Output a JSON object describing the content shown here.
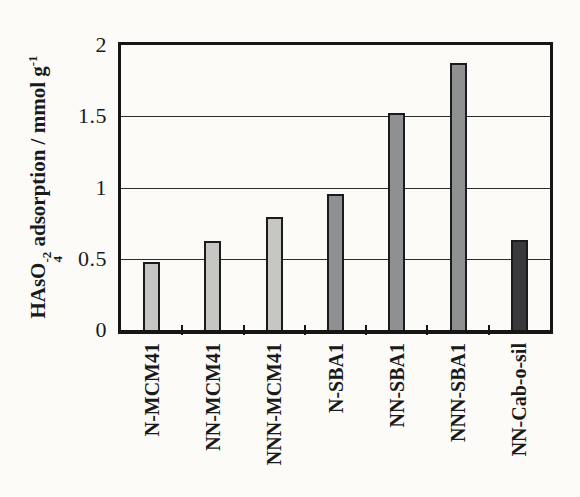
{
  "chart_data": {
    "type": "bar",
    "title": "",
    "xlabel": "",
    "ylabel_text": "HAsO4^-2 adsorption / mmol g^-1",
    "ylabel_parts": {
      "prefix": "HAsO",
      "sub": "4",
      "sup": "-2",
      "middle": " adsorption / mmol g",
      "sup2": "-1"
    },
    "categories": [
      "N-MCM41",
      "NN-MCM41",
      "NNN-MCM41",
      "N-SBA1",
      "NN-SBA1",
      "NNN-SBA1",
      "NN-Cab-o-sil"
    ],
    "values": [
      0.46,
      0.61,
      0.78,
      0.94,
      1.51,
      1.86,
      0.62
    ],
    "bar_colors": [
      "#c6c7c3",
      "#c6c7c3",
      "#c6c7c3",
      "#8e9092",
      "#8e9092",
      "#8e9092",
      "#39393b"
    ],
    "ylim": [
      0,
      2
    ],
    "yticks": [
      0,
      0.5,
      1,
      1.5,
      2
    ],
    "ytick_labels": [
      "0",
      "0.5",
      "1",
      "1.5",
      "2"
    ],
    "grid": true,
    "legend": "none"
  },
  "colors": {
    "background": "#fcfbf8",
    "frame": "#161616",
    "gridline": "#2b2b2b",
    "bar_border": "#1b1b1b",
    "text": "#1a1a1a",
    "bar_light": "#c6c7c3",
    "bar_medium": "#8e9092",
    "bar_dark": "#39393b"
  }
}
